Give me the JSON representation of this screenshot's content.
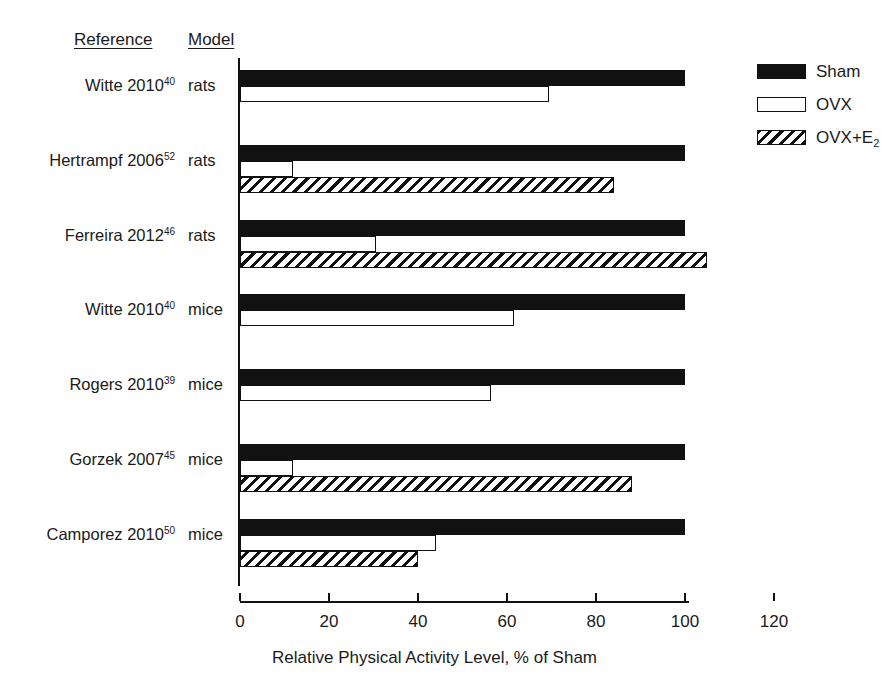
{
  "headers": {
    "reference": "Reference",
    "model": "Model"
  },
  "legend": {
    "items": [
      {
        "label": "Sham",
        "key": "sham",
        "style": "solid-black"
      },
      {
        "label": "OVX",
        "key": "ovx",
        "style": "open-white"
      },
      {
        "label": "OVX+E",
        "key": "ovxe2",
        "style": "diagonal-hatch",
        "subscript": "2"
      }
    ]
  },
  "axis": {
    "title": "Relative Physical Activity Level, % of Sham",
    "ticks": [
      0,
      20,
      40,
      60,
      80,
      100,
      120
    ],
    "min": 0,
    "max": 120
  },
  "chart_data": {
    "type": "bar",
    "orientation": "horizontal",
    "title": "",
    "subtitle": "",
    "xlabel": "Relative Physical Activity Level, % of Sham",
    "ylabel": "",
    "xlim": [
      0,
      120
    ],
    "xticks": [
      0,
      20,
      40,
      60,
      80,
      100,
      120
    ],
    "grid": false,
    "legend_position": "top-right",
    "categories": [
      "Witte 2010 (rats)",
      "Hertrampf 2006 (rats)",
      "Ferreira 2012 (rats)",
      "Witte 2010 (mice)",
      "Rogers 2010 (mice)",
      "Gorzek 2007 (mice)",
      "Camporez 2010 (mice)"
    ],
    "series": [
      {
        "name": "Sham",
        "values": [
          100,
          100,
          100,
          100,
          100,
          100,
          100
        ]
      },
      {
        "name": "OVX",
        "values": [
          69.5,
          12,
          30.5,
          61.5,
          56.5,
          12,
          44
        ]
      },
      {
        "name": "OVX+E2",
        "values": [
          null,
          84,
          105,
          null,
          null,
          88,
          40
        ]
      }
    ],
    "rows": [
      {
        "reference": "Witte 2010",
        "superscript": "40",
        "model": "rats",
        "bars": [
          {
            "series": "Sham",
            "value": 100
          },
          {
            "series": "OVX",
            "value": 69.5
          }
        ]
      },
      {
        "reference": "Hertrampf 2006",
        "superscript": "52",
        "model": "rats",
        "bars": [
          {
            "series": "Sham",
            "value": 100
          },
          {
            "series": "OVX",
            "value": 12
          },
          {
            "series": "OVX+E2",
            "value": 84
          }
        ]
      },
      {
        "reference": "Ferreira 2012",
        "superscript": "46",
        "model": "rats",
        "bars": [
          {
            "series": "Sham",
            "value": 100
          },
          {
            "series": "OVX",
            "value": 30.5
          },
          {
            "series": "OVX+E2",
            "value": 105
          }
        ]
      },
      {
        "reference": "Witte 2010",
        "superscript": "40",
        "model": "mice",
        "bars": [
          {
            "series": "Sham",
            "value": 100
          },
          {
            "series": "OVX",
            "value": 61.5
          }
        ]
      },
      {
        "reference": "Rogers 2010",
        "superscript": "39",
        "model": "mice",
        "bars": [
          {
            "series": "Sham",
            "value": 100
          },
          {
            "series": "OVX",
            "value": 56.5
          }
        ]
      },
      {
        "reference": "Gorzek 2007",
        "superscript": "45",
        "model": "mice",
        "bars": [
          {
            "series": "Sham",
            "value": 100
          },
          {
            "series": "OVX",
            "value": 12
          },
          {
            "series": "OVX+E2",
            "value": 88
          }
        ]
      },
      {
        "reference": "Camporez 2010",
        "superscript": "50",
        "model": "mice",
        "bars": [
          {
            "series": "Sham",
            "value": 100
          },
          {
            "series": "OVX",
            "value": 44
          },
          {
            "series": "OVX+E2",
            "value": 40
          }
        ]
      }
    ]
  },
  "colors": {
    "ink": "#111111",
    "background": "#ffffff",
    "text": "#1a1a1a"
  }
}
